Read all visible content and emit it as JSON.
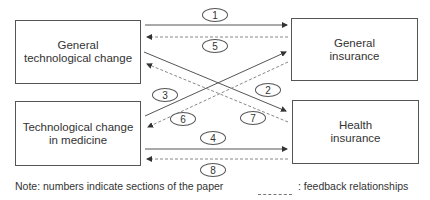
{
  "boxes": {
    "general_tech": {
      "line1": "General",
      "line2": "technological change"
    },
    "general_ins": {
      "line1": "General",
      "line2": "insurance"
    },
    "med_tech": {
      "line1": "Technological change",
      "line2": "in medicine"
    },
    "health_ins": {
      "line1": "Health",
      "line2": "insurance"
    }
  },
  "arrows": [
    {
      "id": "1",
      "from": "General technological change",
      "to": "General insurance",
      "style": "solid"
    },
    {
      "id": "2",
      "from": "General technological change",
      "to": "Health insurance",
      "style": "solid"
    },
    {
      "id": "3",
      "from": "Technological change in medicine",
      "to": "General insurance",
      "style": "solid"
    },
    {
      "id": "4",
      "from": "Technological change in medicine",
      "to": "Health insurance",
      "style": "solid"
    },
    {
      "id": "5",
      "from": "General insurance",
      "to": "General technological change",
      "style": "dashed"
    },
    {
      "id": "6",
      "from": "General insurance",
      "to": "Technological change in medicine",
      "style": "dashed"
    },
    {
      "id": "7",
      "from": "Health insurance",
      "to": "General technological change",
      "style": "dashed"
    },
    {
      "id": "8",
      "from": "Health insurance",
      "to": "Technological change in medicine",
      "style": "dashed"
    }
  ],
  "labels": {
    "n1": "1",
    "n2": "2",
    "n3": "3",
    "n4": "4",
    "n5": "5",
    "n6": "6",
    "n7": "7",
    "n8": "8"
  },
  "footer": {
    "note": "Note: numbers indicate sections of the paper",
    "legend": ": feedback relationships"
  },
  "colors": {
    "line": "#555555",
    "dashed": "#888888",
    "text": "#333333"
  }
}
